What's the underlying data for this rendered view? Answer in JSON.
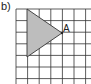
{
  "figure": {
    "label": "b)",
    "grid": {
      "cols": 7,
      "rows": 7,
      "x0": 16,
      "y0": 9,
      "cell": 11.6,
      "line_color": "#333333"
    },
    "triangle": {
      "vertices": [
        [
          27,
          9
        ],
        [
          27,
          57
        ],
        [
          62,
          33
        ]
      ],
      "fill": "#bdbdbd",
      "stroke": "#333333"
    },
    "vertex_label": {
      "text": "A",
      "x": 63,
      "y": 32
    }
  }
}
